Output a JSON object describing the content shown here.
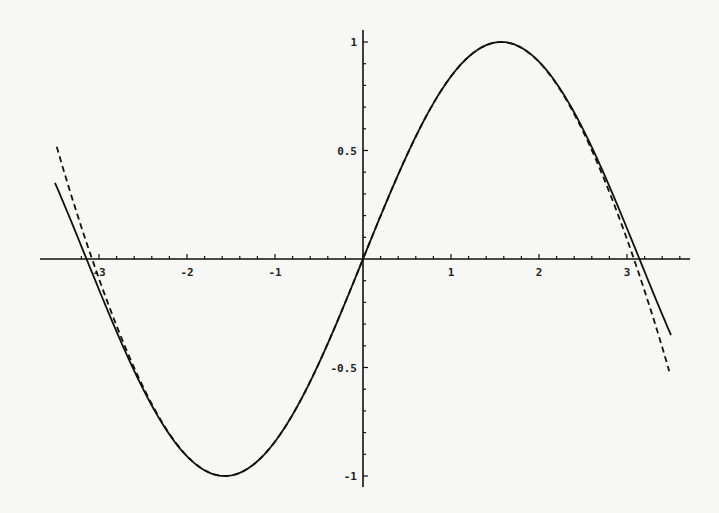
{
  "chart_data": {
    "type": "line",
    "title": "",
    "xlabel": "",
    "ylabel": "",
    "xlim": [
      -3.6,
      3.7
    ],
    "ylim": [
      -1.05,
      1.05
    ],
    "grid": false,
    "legend": null,
    "x_ticks": [
      {
        "value": -3,
        "label": "-3"
      },
      {
        "value": -2,
        "label": "-2"
      },
      {
        "value": -1,
        "label": "-1"
      },
      {
        "value": 1,
        "label": "1"
      },
      {
        "value": 2,
        "label": "2"
      },
      {
        "value": 3,
        "label": "3"
      }
    ],
    "y_ticks": [
      {
        "value": 1,
        "label": "1"
      },
      {
        "value": 0.5,
        "label": "0.5"
      },
      {
        "value": -0.5,
        "label": "-0.5"
      },
      {
        "value": -1,
        "label": "-1"
      }
    ],
    "series": [
      {
        "name": "sin(x)",
        "style": "solid",
        "color": "#111111",
        "x_range": [
          -3.5,
          3.5
        ],
        "x": [
          -3.5,
          -3.0,
          -2.5,
          -2.0,
          -1.5708,
          -1.0,
          -0.5,
          0,
          0.5,
          1.0,
          1.5708,
          2.0,
          2.5,
          3.0,
          3.5
        ],
        "y": [
          0.351,
          -0.141,
          -0.598,
          -0.909,
          -1.0,
          -0.841,
          -0.479,
          0,
          0.479,
          0.841,
          1.0,
          0.909,
          0.598,
          0.141,
          -0.351
        ]
      },
      {
        "name": "x - x^3/6 + x^5/120 - x^7/5040",
        "style": "dashed",
        "color": "#111111",
        "x_range": [
          -3.48,
          3.48
        ],
        "x": [
          -3.48,
          -3.0,
          -2.5,
          -2.0,
          -1.5708,
          -1.0,
          -0.5,
          0,
          0.5,
          1.0,
          1.5708,
          2.0,
          2.5,
          3.0,
          3.48
        ],
        "y": [
          0.521,
          -0.152,
          -0.599,
          -0.909,
          -1.0,
          -0.841,
          -0.479,
          0,
          0.479,
          0.841,
          1.0,
          0.909,
          0.599,
          0.152,
          -0.521
        ]
      }
    ]
  }
}
